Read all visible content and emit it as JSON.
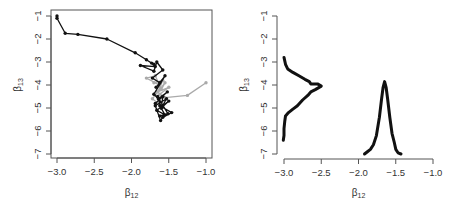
{
  "chart_data": [
    {
      "type": "line",
      "title": "",
      "description": "Trace of parameter pairs (beta12, beta13); black trajectory starting at (-3.0,-1.0) converging to a cluster near (-1.65,-4.5); grey trajectory starting at (-1.0,-3.9)",
      "xlabel": "β12",
      "ylabel": "β13",
      "xlim": [
        -3.05,
        -0.95
      ],
      "ylim": [
        -7.1,
        -0.9
      ],
      "xticks": [
        "-3.0",
        "-2.5",
        "-2.0",
        "-1.5",
        "-1.0"
      ],
      "yticks": [
        "-1",
        "-2",
        "-3",
        "-4",
        "-5",
        "-6",
        "-7"
      ],
      "box": true,
      "series": [
        {
          "name": "chain-black",
          "color": "#111111",
          "x": [
            -3.0,
            -3.0,
            -2.89,
            -2.72,
            -2.33,
            -1.95,
            -1.8,
            -1.73,
            -1.7,
            -1.68,
            -1.88,
            -1.7,
            -1.66,
            -1.58,
            -1.72,
            -1.62,
            -1.67,
            -1.55,
            -1.7,
            -1.64,
            -1.52,
            -1.68,
            -1.58,
            -1.6,
            -1.5,
            -1.66,
            -1.55,
            -1.62,
            -1.46,
            -1.58,
            -1.61,
            -1.68,
            -1.53,
            -1.6,
            -1.65,
            -1.51,
            -1.62
          ],
          "y": [
            -1.0,
            -1.1,
            -1.75,
            -1.8,
            -2.0,
            -2.6,
            -2.9,
            -3.05,
            -3.1,
            -3.2,
            -3.15,
            -3.4,
            -3.0,
            -3.35,
            -3.7,
            -3.9,
            -4.1,
            -3.6,
            -4.4,
            -4.6,
            -4.3,
            -4.8,
            -4.5,
            -5.0,
            -4.7,
            -5.1,
            -5.3,
            -4.9,
            -5.2,
            -5.4,
            -5.55,
            -4.9,
            -4.6,
            -5.0,
            -4.5,
            -5.25,
            -5.35
          ]
        },
        {
          "name": "chain-grey",
          "color": "#aaaaaa",
          "x": [
            -1.0,
            -1.25,
            -1.55,
            -1.62,
            -1.5,
            -1.65,
            -1.58,
            -1.7,
            -1.62,
            -1.8,
            -1.68,
            -1.6,
            -1.55,
            -1.72,
            -1.64
          ],
          "y": [
            -3.9,
            -4.45,
            -4.55,
            -4.4,
            -4.1,
            -4.3,
            -3.8,
            -3.9,
            -4.0,
            -3.7,
            -3.6,
            -4.2,
            -3.9,
            -4.6,
            -4.8
          ]
        }
      ]
    },
    {
      "type": "line",
      "title": "",
      "description": "Marginal density curves: density of beta13 drawn sideways from x=-3.0 (peak at y=-4, reaching x≈-2.5) and density of beta12 drawn upward from y=-7 (peak at x≈-1.65 reaching y≈-3.8)",
      "xlabel": "β12",
      "ylabel": "β13",
      "xlim": [
        -3.05,
        -0.95
      ],
      "ylim": [
        -7.1,
        -0.9
      ],
      "xticks": [
        "-3.0",
        "-2.5",
        "-2.0",
        "-1.5",
        "-1.0"
      ],
      "yticks": [
        "-1",
        "-2",
        "-3",
        "-4",
        "-5",
        "-6",
        "-7"
      ],
      "box": false,
      "series": [
        {
          "name": "density-beta13",
          "color": "#111111",
          "x": [
            -3.0,
            -2.98,
            -2.95,
            -2.88,
            -2.8,
            -2.72,
            -2.66,
            -2.64,
            -2.55,
            -2.5,
            -2.58,
            -2.64,
            -2.68,
            -2.75,
            -2.82,
            -2.88,
            -2.94,
            -2.98,
            -2.99,
            -3.0,
            -3.0,
            -3.01
          ],
          "y": [
            -2.8,
            -3.1,
            -3.3,
            -3.45,
            -3.6,
            -3.75,
            -3.85,
            -3.95,
            -3.95,
            -4.05,
            -4.2,
            -4.3,
            -4.45,
            -4.65,
            -4.9,
            -5.05,
            -5.2,
            -5.35,
            -5.6,
            -5.9,
            -6.2,
            -6.4
          ]
        },
        {
          "name": "density-beta12",
          "color": "#111111",
          "x": [
            -1.92,
            -1.88,
            -1.84,
            -1.8,
            -1.76,
            -1.72,
            -1.69,
            -1.67,
            -1.65,
            -1.63,
            -1.61,
            -1.58,
            -1.55,
            -1.52,
            -1.5,
            -1.47,
            -1.43
          ],
          "y": [
            -7.0,
            -6.9,
            -6.8,
            -6.6,
            -6.2,
            -5.4,
            -4.6,
            -4.1,
            -3.85,
            -4.1,
            -4.6,
            -5.4,
            -6.1,
            -6.5,
            -6.8,
            -6.95,
            -7.0
          ]
        }
      ]
    }
  ],
  "panels": {
    "left": {
      "xlabel_main": "β",
      "xlabel_sub": "12",
      "ylabel_main": "β",
      "ylabel_sub": "13"
    },
    "right": {
      "xlabel_main": "β",
      "xlabel_sub": "12",
      "ylabel_main": "β",
      "ylabel_sub": "13"
    }
  },
  "colors": {
    "axis": "#555555",
    "text": "#333333",
    "black_series": "#111111",
    "grey_series": "#aaaaaa"
  }
}
